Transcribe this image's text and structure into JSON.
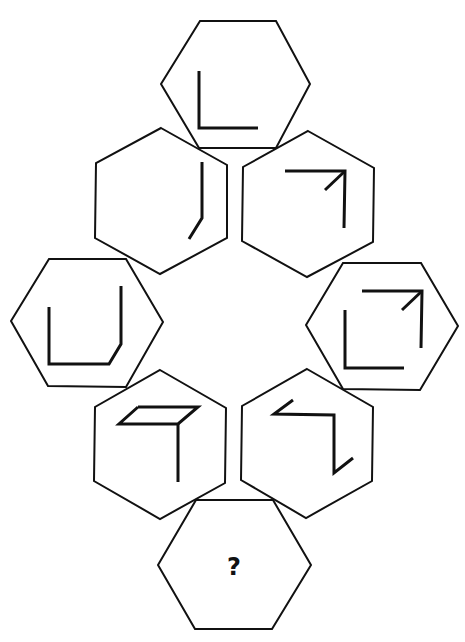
{
  "puzzle": {
    "type": "hexagon sequence puzzle",
    "question_mark": "?",
    "stroke_color": "#111111",
    "background": "#ffffff",
    "hexagons": [
      {
        "id": "top",
        "points": "200,21 276,21 310,84 276,148 199,148 161,84",
        "glyphs": [
          {
            "name": "l-shape",
            "points": "199,71 199,128 258,128"
          }
        ]
      },
      {
        "id": "upper-left",
        "points": "161,128 227,165 227,238 160,274 95,238 96,163",
        "glyphs": [
          {
            "name": "bent-line",
            "points": "202,162 202,218 189,239"
          }
        ]
      },
      {
        "id": "upper-right",
        "points": "308,131 374,168 373,242 307,277 242,241 243,167",
        "glyphs": [
          {
            "name": "corner-arrow",
            "points": "285,171 345,171 344,228"
          },
          {
            "name": "arrow-diagonal",
            "points": "345,171 325,190"
          }
        ]
      },
      {
        "id": "middle-left",
        "points": "49,259 126,259 163,322 126,387 48,386 11,321",
        "glyphs": [
          {
            "name": "u-shape",
            "points": "49,307 49,364 109,364 121,344 121,286"
          }
        ]
      },
      {
        "id": "middle-right",
        "points": "343,263 421,263 458,326 420,390 343,389 306,325",
        "glyphs": [
          {
            "name": "l-shape",
            "points": "345,310 345,368 404,368"
          },
          {
            "name": "corner-arrow",
            "points": "362,291 422,291 421,348"
          },
          {
            "name": "arrow-diagonal",
            "points": "422,291 402,310"
          }
        ]
      },
      {
        "id": "lower-left",
        "points": "160,370 226,408 225,483 160,519 94,481 95,407",
        "glyphs": [
          {
            "name": "parallelogram",
            "points": "138,407 198,407 178,424 119,424 138,407"
          },
          {
            "name": "vertical-line",
            "points": "178,424 178,482"
          }
        ]
      },
      {
        "id": "lower-right",
        "points": "307,369 373,407 372,481 306,518 241,480 242,406",
        "glyphs": [
          {
            "name": "zigzag",
            "points": "293,400 274,414 334,415 334,473 353,458"
          }
        ]
      },
      {
        "id": "bottom",
        "points": "196,500 273,500 311,565 272,629 195,629 158,565",
        "glyphs": []
      }
    ]
  }
}
